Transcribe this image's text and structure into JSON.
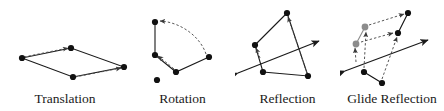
{
  "figure": {
    "width": 444,
    "height": 111,
    "background": "#ffffff",
    "stroke_color": "#1a1a1a",
    "ghost_color": "#8c8c8c",
    "dashed_color": "#4d4d4d"
  },
  "panels": [
    {
      "id": "translation",
      "label": "Translation",
      "solid_polyline_points": "22,58 71,48 124,67 73,77 22,58",
      "dashed_vectors": [
        {
          "x1": 24,
          "y1": 57,
          "x2": 68,
          "y2": 48
        },
        {
          "x1": 75,
          "y1": 77,
          "x2": 121,
          "y2": 68
        }
      ],
      "dots": [
        {
          "cx": 22,
          "cy": 58,
          "r": 3.1,
          "fill": "#111111"
        },
        {
          "cx": 71,
          "cy": 48,
          "r": 3.1,
          "fill": "#111111"
        },
        {
          "cx": 124,
          "cy": 67,
          "r": 3.1,
          "fill": "#111111"
        },
        {
          "cx": 73,
          "cy": 77,
          "r": 3.1,
          "fill": "#111111"
        }
      ]
    },
    {
      "id": "rotation",
      "label": "Rotation",
      "solid_polyline_points": "155,22 155,55 176,72 209,57",
      "pivot_dot": {
        "cx": 157,
        "cy": 80,
        "r": 3.1,
        "fill": "#111111"
      },
      "dashed_arcs": [
        {
          "d": "M 206,54 C 200,36 180,22 160,21",
          "label": "outer-arc"
        },
        {
          "d": "M 174,69 C 167,63 162,59 158,56",
          "label": "inner-arc"
        }
      ],
      "dots": [
        {
          "cx": 155,
          "cy": 22,
          "r": 3.1,
          "fill": "#111111"
        },
        {
          "cx": 155,
          "cy": 55,
          "r": 3.1,
          "fill": "#111111"
        },
        {
          "cx": 176,
          "cy": 72,
          "r": 3.1,
          "fill": "#111111"
        },
        {
          "cx": 209,
          "cy": 57,
          "r": 3.1,
          "fill": "#111111"
        }
      ]
    },
    {
      "id": "reflection",
      "label": "Reflection",
      "mirror_line": {
        "x1": 238,
        "y1": 73,
        "x2": 319,
        "y2": 41
      },
      "solid_polyline_points": "287,13 255,45 263,72 308,76 287,13",
      "dashed_vectors": [
        {
          "x1": 260,
          "y1": 58,
          "x2": 256,
          "y2": 48
        },
        {
          "x1": 307,
          "y1": 73,
          "x2": 288,
          "y2": 17
        }
      ],
      "dots": [
        {
          "cx": 287,
          "cy": 13,
          "r": 3.1,
          "fill": "#111111"
        },
        {
          "cx": 255,
          "cy": 45,
          "r": 3.1,
          "fill": "#111111"
        },
        {
          "cx": 263,
          "cy": 72,
          "r": 3.1,
          "fill": "#111111"
        },
        {
          "cx": 308,
          "cy": 76,
          "r": 3.1,
          "fill": "#111111"
        }
      ]
    },
    {
      "id": "glide",
      "label": "Glide Reflection",
      "mirror_line": {
        "x1": 345,
        "y1": 71,
        "x2": 428,
        "y2": 40
      },
      "solid_segments": [
        {
          "x1": 356,
          "y1": 44,
          "x2": 365,
          "y2": 27,
          "color": "#8c8c8c"
        },
        {
          "x1": 408,
          "y1": 13,
          "x2": 398,
          "y2": 33,
          "color": "#111111"
        },
        {
          "x1": 364,
          "y1": 72,
          "x2": 382,
          "y2": 83,
          "color": "#111111"
        }
      ],
      "dashed_vectors": [
        {
          "x1": 356,
          "y1": 62,
          "x2": 355,
          "y2": 48
        },
        {
          "x1": 364,
          "y1": 68,
          "x2": 366,
          "y2": 32
        },
        {
          "x1": 382,
          "y1": 79,
          "x2": 397,
          "y2": 37
        },
        {
          "x1": 369,
          "y1": 25,
          "x2": 404,
          "y2": 14
        },
        {
          "x1": 361,
          "y1": 42,
          "x2": 393,
          "y2": 33
        }
      ],
      "ghost_dots": [
        {
          "cx": 365,
          "cy": 27,
          "r": 3.4,
          "fill": "#8c8c8c"
        },
        {
          "cx": 356,
          "cy": 44,
          "r": 3.4,
          "fill": "#8c8c8c"
        }
      ],
      "dots": [
        {
          "cx": 408,
          "cy": 13,
          "r": 3.1,
          "fill": "#111111"
        },
        {
          "cx": 398,
          "cy": 33,
          "r": 3.1,
          "fill": "#111111"
        },
        {
          "cx": 364,
          "cy": 72,
          "r": 3.1,
          "fill": "#111111"
        },
        {
          "cx": 382,
          "cy": 83,
          "r": 3.1,
          "fill": "#111111"
        }
      ]
    }
  ]
}
